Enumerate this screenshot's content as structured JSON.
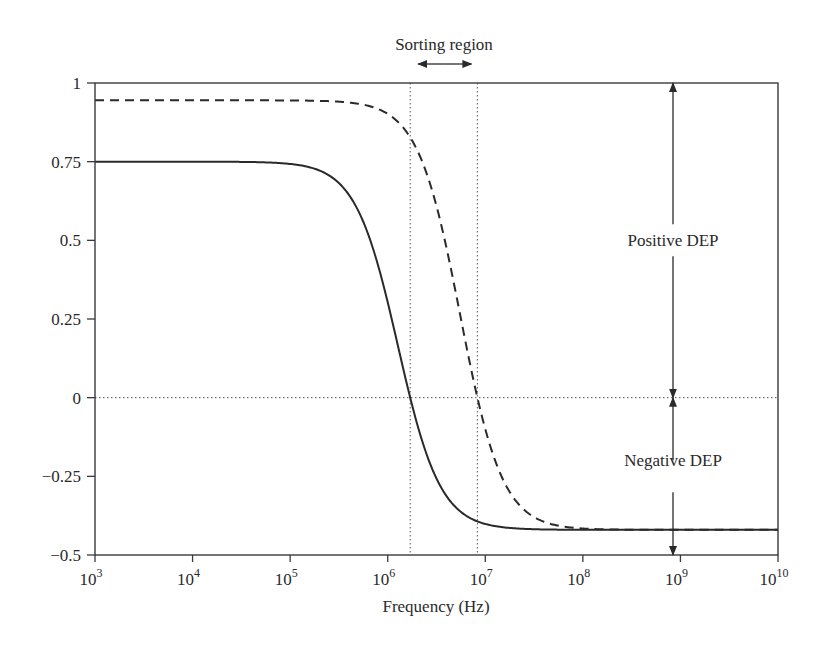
{
  "chart_data": {
    "type": "line",
    "title": "",
    "xlabel": "Frequency (Hz)",
    "ylabel": "",
    "xscale": "log",
    "xlim": [
      1000,
      10000000000
    ],
    "ylim": [
      -0.5,
      1
    ],
    "grid": false,
    "legend": null,
    "x_ticks": [
      {
        "base": "10",
        "exp": "3"
      },
      {
        "base": "10",
        "exp": "4"
      },
      {
        "base": "10",
        "exp": "5"
      },
      {
        "base": "10",
        "exp": "6"
      },
      {
        "base": "10",
        "exp": "7"
      },
      {
        "base": "10",
        "exp": "8"
      },
      {
        "base": "10",
        "exp": "9"
      },
      {
        "base": "10",
        "exp": "10"
      }
    ],
    "y_ticks": [
      "1",
      "0.75",
      "0.5",
      "0.25",
      "0",
      "−0.25",
      "−0.5"
    ],
    "y_tick_values": [
      1,
      0.75,
      0.5,
      0.25,
      0,
      -0.25,
      -0.5
    ],
    "series": [
      {
        "name": "solid",
        "style": "solid",
        "low_freq_value": 0.75,
        "high_freq_value": -0.42,
        "crossover_frequency_hz": 1700000,
        "x": [
          1000,
          10000,
          100000,
          316000,
          1000000,
          1700000,
          3160000,
          10000000,
          100000000,
          1000000000,
          10000000000
        ],
        "values": [
          0.75,
          0.75,
          0.74,
          0.7,
          0.35,
          0.0,
          -0.29,
          -0.4,
          -0.42,
          -0.42,
          -0.42
        ]
      },
      {
        "name": "dashed",
        "style": "dashed",
        "low_freq_value": 0.945,
        "high_freq_value": -0.42,
        "crossover_frequency_hz": 8300000,
        "x": [
          1000,
          10000,
          100000,
          1000000,
          1700000,
          3160000,
          8300000,
          31600000,
          100000000,
          1000000000,
          10000000000
        ],
        "values": [
          0.945,
          0.945,
          0.945,
          0.9,
          0.84,
          0.62,
          0.0,
          -0.33,
          -0.41,
          -0.42,
          -0.42
        ]
      }
    ],
    "reference_lines": [
      {
        "orientation": "horizontal",
        "y": 0,
        "style": "dotted"
      },
      {
        "orientation": "vertical",
        "x": 1700000,
        "style": "dotted"
      },
      {
        "orientation": "vertical",
        "x": 8300000,
        "style": "dotted"
      }
    ],
    "annotations": [
      {
        "text": "Sorting region",
        "type": "double-arrow-horizontal",
        "x_from": 1700000,
        "x_to": 8300000
      },
      {
        "text": "Positive DEP",
        "type": "double-arrow-vertical",
        "x": 800000000,
        "y_from": 0,
        "y_to": 1
      },
      {
        "text": "Negative DEP",
        "type": "double-arrow-vertical",
        "x": 800000000,
        "y_from": -0.5,
        "y_to": 0
      }
    ]
  }
}
